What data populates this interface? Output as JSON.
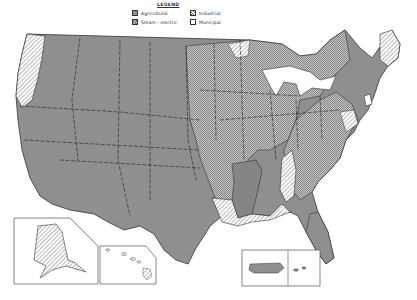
{
  "legend": {
    "title": "LEGEND",
    "items": [
      {
        "label": "Agricultural",
        "pattern": "solid-gray",
        "color": "#8f8f8f"
      },
      {
        "label": "Steam - electric",
        "pattern": "cross-hatch",
        "color": "#b5b5b5"
      },
      {
        "label": "Industrial",
        "pattern": "diagonal-hatch",
        "color": "#ffffff"
      },
      {
        "label": "Municipal",
        "pattern": "white-dotted",
        "color": "#ffffff"
      }
    ]
  },
  "map": {
    "subject": "United States water use by predominant category per region",
    "insets": [
      "Alaska",
      "Hawaii",
      "Puerto Rico and Virgin Islands"
    ],
    "regions": [
      {
        "name": "Pacific Northwest coast",
        "category": "Industrial"
      },
      {
        "name": "West / Great Plains",
        "category": "Agricultural"
      },
      {
        "name": "Texas / Gulf",
        "category": "Agricultural"
      },
      {
        "name": "Lower Mississippi",
        "category": "Agricultural"
      },
      {
        "name": "Midwest / Ohio Valley",
        "category": "Steam - electric"
      },
      {
        "name": "Southeast",
        "category": "Steam - electric"
      },
      {
        "name": "Gulf coast (LA, AL, FL panhandle)",
        "category": "Industrial"
      },
      {
        "name": "New England (Maine)",
        "category": "Industrial"
      },
      {
        "name": "Florida peninsula",
        "category": "Agricultural"
      },
      {
        "name": "Alaska",
        "category": "Industrial"
      },
      {
        "name": "Hawaii",
        "category": "Industrial"
      },
      {
        "name": "Puerto Rico",
        "category": "Agricultural"
      },
      {
        "name": "New Jersey area",
        "category": "Municipal"
      }
    ]
  }
}
